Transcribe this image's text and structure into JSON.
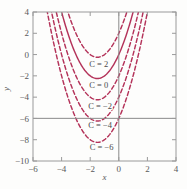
{
  "chart_data": {
    "type": "line",
    "title": "",
    "subtitle": "",
    "xlabel": "x",
    "ylabel": "y",
    "xlim": [
      -6,
      4
    ],
    "ylim": [
      -10,
      4
    ],
    "xticks": [
      -6,
      -4,
      -2,
      0,
      2,
      4
    ],
    "yticks": [
      -10,
      -8,
      -6,
      -4,
      -2,
      0,
      2,
      4
    ],
    "xticklabels": [
      "−6",
      "−4",
      "−2",
      "0",
      "2",
      "4"
    ],
    "yticklabels": [
      "−10",
      "−8",
      "−6",
      "−4",
      "−2",
      "0",
      "2",
      "4"
    ],
    "grid": false,
    "legend_position": "inline-labels",
    "curve_color": "#b4335a",
    "axis_color": "#8a8a8a",
    "vertex_x": -1.5,
    "series": [
      {
        "name": "C = 2",
        "label": "C = 2",
        "C": 2,
        "style": "dashed",
        "vertex": [
          -1.5,
          -0.25
        ],
        "equation": "y = x^2 + 3x + 2",
        "points_x": [
          -5.0,
          -4.5,
          -4.0,
          -3.5,
          -3.0,
          -2.5,
          -2.0,
          -1.5,
          -1.0,
          -0.5,
          0.0,
          0.5,
          1.0,
          1.5
        ],
        "points_y": [
          12.0,
          8.75,
          6.0,
          3.75,
          2.0,
          0.75,
          0.0,
          -0.25,
          0.0,
          0.75,
          2.0,
          3.75,
          6.0,
          8.75
        ]
      },
      {
        "name": "C = 0",
        "label": "C = 0",
        "C": 0,
        "style": "solid",
        "vertex": [
          -1.5,
          -2.25
        ],
        "equation": "y = x^2 + 3x",
        "points_x": [
          -5.0,
          -4.5,
          -4.0,
          -3.5,
          -3.0,
          -2.5,
          -2.0,
          -1.5,
          -1.0,
          -0.5,
          0.0,
          0.5,
          1.0,
          1.5
        ],
        "points_y": [
          10.0,
          6.75,
          4.0,
          1.75,
          0.0,
          -1.25,
          -2.0,
          -2.25,
          -2.0,
          -1.25,
          0.0,
          1.75,
          4.0,
          6.75
        ]
      },
      {
        "name": "C = -2",
        "label": "C = −2",
        "C": -2,
        "style": "dashed",
        "vertex": [
          -1.5,
          -4.25
        ],
        "equation": "y = x^2 + 3x - 2",
        "points_x": [
          -5.0,
          -4.5,
          -4.0,
          -3.5,
          -3.0,
          -2.5,
          -2.0,
          -1.5,
          -1.0,
          -0.5,
          0.0,
          0.5,
          1.0,
          1.5
        ],
        "points_y": [
          8.0,
          4.75,
          2.0,
          -0.25,
          -2.0,
          -3.25,
          -4.0,
          -4.25,
          -4.0,
          -3.25,
          -2.0,
          -0.25,
          2.0,
          4.75
        ]
      },
      {
        "name": "C = -4",
        "label": "C = −4",
        "C": -4,
        "style": "dashed",
        "vertex": [
          -1.5,
          -6.25
        ],
        "equation": "y = x^2 + 3x - 4",
        "points_x": [
          -5.0,
          -4.5,
          -4.0,
          -3.5,
          -3.0,
          -2.5,
          -2.0,
          -1.5,
          -1.0,
          -0.5,
          0.0,
          0.5,
          1.0,
          1.5
        ],
        "points_y": [
          6.0,
          2.75,
          0.0,
          -2.25,
          -4.0,
          -5.25,
          -6.0,
          -6.25,
          -6.0,
          -5.25,
          -4.0,
          -2.25,
          0.0,
          2.75
        ]
      },
      {
        "name": "C = -6",
        "label": "C = −6",
        "C": -6,
        "style": "dashed",
        "vertex": [
          -1.5,
          -8.25
        ],
        "equation": "y = x^2 + 3x - 6",
        "points_x": [
          -5.0,
          -4.5,
          -4.0,
          -3.5,
          -3.0,
          -2.5,
          -2.0,
          -1.5,
          -1.0,
          -0.5,
          0.0,
          0.5,
          1.0,
          1.5
        ],
        "points_y": [
          4.0,
          0.75,
          -2.0,
          -4.25,
          -6.0,
          -7.25,
          -8.0,
          -8.25,
          -8.0,
          -7.25,
          -6.0,
          -4.25,
          -2.0,
          0.75
        ]
      }
    ],
    "annotations": [
      {
        "text": "C = 2",
        "x": -1.4,
        "y": -0.85
      },
      {
        "text": "C = 0",
        "x": -1.4,
        "y": -2.85
      },
      {
        "text": "C = −2",
        "x": -1.3,
        "y": -4.85
      },
      {
        "text": "C = −4",
        "x": -1.3,
        "y": -6.65
      },
      {
        "text": "C = −6",
        "x": -1.2,
        "y": -8.65
      }
    ]
  },
  "figure": {
    "background_color": "#fdfdfc",
    "curve_color": "#b4335a",
    "axis_color": "#8a8a8a",
    "frame_color": "#9a9a9a"
  }
}
